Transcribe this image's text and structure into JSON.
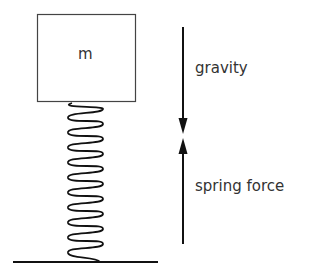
{
  "diagram": {
    "mass": {
      "label": "m"
    },
    "forces": [
      {
        "name": "gravity",
        "label": "gravity",
        "direction": "down"
      },
      {
        "name": "spring-force",
        "label": "spring force",
        "direction": "up"
      }
    ],
    "elements": [
      "mass-box",
      "spring",
      "ground-line",
      "gravity-arrow",
      "spring-force-arrow"
    ],
    "colors": {
      "stroke": "#111111",
      "text": "#333333",
      "background": "#ffffff"
    }
  }
}
